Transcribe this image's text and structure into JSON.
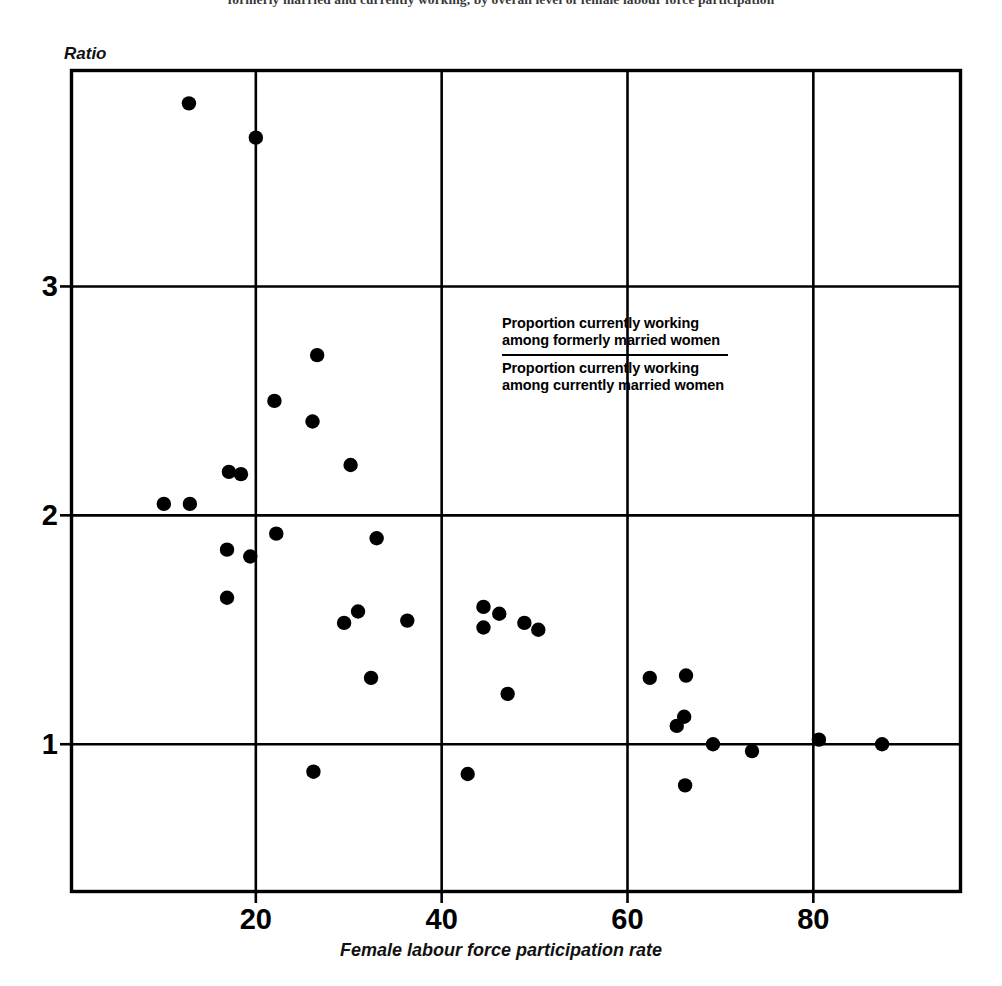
{
  "caption": {
    "text": "formerly married and currently working, by overall level of female labour force participation"
  },
  "axes": {
    "y_title": "Ratio",
    "x_title": "Female labour force participation rate",
    "x_ticks": [
      "20",
      "40",
      "60",
      "80"
    ],
    "y_ticks": [
      "1",
      "2",
      "3"
    ]
  },
  "legend": {
    "numerator": "Proportion currently working among formerly married women",
    "denominator": "Proportion currently working among currently married women"
  },
  "colors": {
    "marker": "#000000",
    "axis": "#000000",
    "grid": "#000000",
    "background": "#ffffff"
  },
  "chart_data": {
    "type": "scatter",
    "title": "formerly married and currently working, by overall level of female labour force participation",
    "xlabel": "Female labour force participation rate",
    "ylabel": "Ratio",
    "xlim": [
      0,
      96
    ],
    "ylim": [
      0.35,
      3.95
    ],
    "xticks": [
      20,
      40,
      60,
      80
    ],
    "yticks": [
      1,
      2,
      3
    ],
    "grid": true,
    "legend": "Proportion currently working among formerly married women / Proportion currently working among currently married women",
    "points": [
      {
        "x": 12.8,
        "y": 3.8
      },
      {
        "x": 20.0,
        "y": 3.65
      },
      {
        "x": 26.6,
        "y": 2.7
      },
      {
        "x": 22.0,
        "y": 2.5
      },
      {
        "x": 26.1,
        "y": 2.41
      },
      {
        "x": 17.1,
        "y": 2.19
      },
      {
        "x": 18.4,
        "y": 2.18
      },
      {
        "x": 30.2,
        "y": 2.22
      },
      {
        "x": 10.1,
        "y": 2.05
      },
      {
        "x": 12.9,
        "y": 2.05
      },
      {
        "x": 22.2,
        "y": 1.92
      },
      {
        "x": 33.0,
        "y": 1.9
      },
      {
        "x": 16.9,
        "y": 1.85
      },
      {
        "x": 19.4,
        "y": 1.82
      },
      {
        "x": 16.9,
        "y": 1.64
      },
      {
        "x": 31.0,
        "y": 1.58
      },
      {
        "x": 29.5,
        "y": 1.53
      },
      {
        "x": 36.3,
        "y": 1.54
      },
      {
        "x": 44.5,
        "y": 1.6
      },
      {
        "x": 46.2,
        "y": 1.57
      },
      {
        "x": 44.5,
        "y": 1.51
      },
      {
        "x": 48.9,
        "y": 1.53
      },
      {
        "x": 50.4,
        "y": 1.5
      },
      {
        "x": 32.4,
        "y": 1.29
      },
      {
        "x": 47.1,
        "y": 1.22
      },
      {
        "x": 62.4,
        "y": 1.29
      },
      {
        "x": 66.3,
        "y": 1.3
      },
      {
        "x": 66.1,
        "y": 1.12
      },
      {
        "x": 65.3,
        "y": 1.08
      },
      {
        "x": 69.2,
        "y": 1.0
      },
      {
        "x": 73.4,
        "y": 0.97
      },
      {
        "x": 80.6,
        "y": 1.02
      },
      {
        "x": 87.4,
        "y": 1.0
      },
      {
        "x": 26.2,
        "y": 0.88
      },
      {
        "x": 42.8,
        "y": 0.87
      },
      {
        "x": 66.2,
        "y": 0.82
      }
    ]
  }
}
